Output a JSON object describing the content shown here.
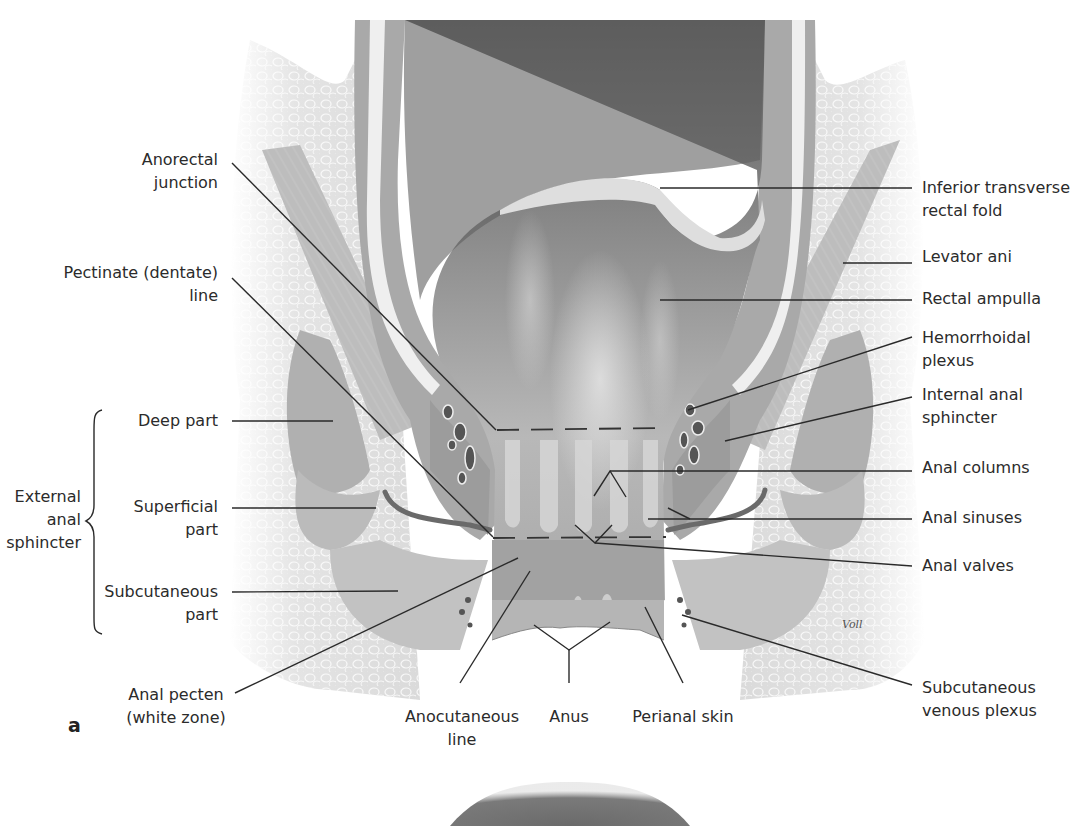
{
  "figure": {
    "panel_letter": "a",
    "artist_signature": "Voll"
  },
  "labels_left": {
    "anorectal_junction": [
      "Anorectal",
      "junction"
    ],
    "pectinate_line": [
      "Pectinate (dentate)",
      "line"
    ],
    "deep_part": [
      "Deep part"
    ],
    "superficial_part": [
      "Superficial",
      "part"
    ],
    "subcutaneous_part": [
      "Subcutaneous",
      "part"
    ],
    "external_anal_sphincter": [
      "External",
      "anal",
      "sphincter"
    ],
    "anal_pecten": [
      "Anal pecten",
      "(white zone)"
    ]
  },
  "labels_bottom": {
    "anocutaneous_line": [
      "Anocutaneous",
      "line"
    ],
    "anus": [
      "Anus"
    ],
    "perianal_skin": [
      "Perianal skin"
    ]
  },
  "labels_right": {
    "inferior_transverse_rectal_fold": [
      "Inferior transverse",
      "rectal fold"
    ],
    "levator_ani": [
      "Levator ani"
    ],
    "rectal_ampulla": [
      "Rectal ampulla"
    ],
    "hemorrhoidal_plexus": [
      "Hemorrhoidal",
      "plexus"
    ],
    "internal_anal_sphincter": [
      "Internal anal",
      "sphincter"
    ],
    "anal_columns": [
      "Anal columns"
    ],
    "anal_sinuses": [
      "Anal sinuses"
    ],
    "anal_valves": [
      "Anal valves"
    ],
    "subcutaneous_venous_plexus": [
      "Subcutaneous",
      "venous plexus"
    ]
  },
  "colors": {
    "leader_line": "#2a2a2a",
    "lumen_dark": "#6e6e6e",
    "lumen_light": "#c9c9c9",
    "muscle": "#b3b3b3",
    "fat": "#e6e6e6",
    "mucosa_edge": "#f4f4f4",
    "perianal_hair": "#707070"
  }
}
